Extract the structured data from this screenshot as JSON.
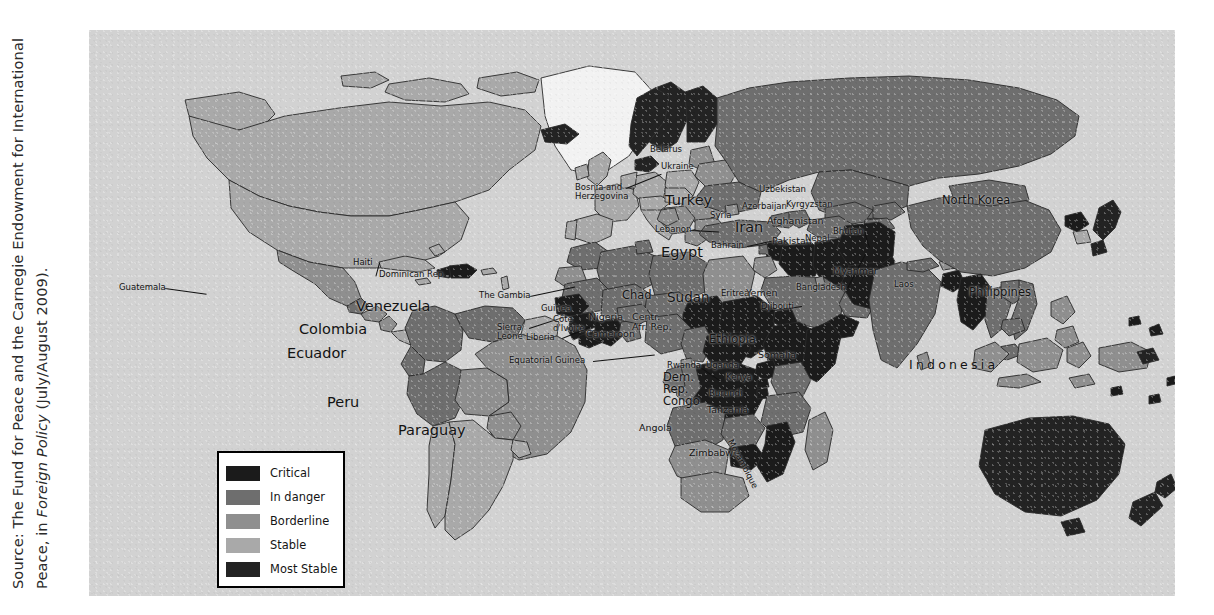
{
  "source": {
    "prefix": "Source: The Fund for Peace and the Carnegie Endowment for International Peace, in ",
    "italic": "Foreign Policy",
    "suffix": " (July/August 2009)."
  },
  "legend": {
    "title": "Failed States Index",
    "items": [
      {
        "label": "Critical",
        "color": "#1b1b1b"
      },
      {
        "label": "In danger",
        "color": "#6e6e6e"
      },
      {
        "label": "Borderline",
        "color": "#8f8f8f"
      },
      {
        "label": "Stable",
        "color": "#a9a9a9"
      },
      {
        "label": "Most Stable",
        "color": "#232323"
      }
    ]
  },
  "map": {
    "ocean_color": "#d2d2d2",
    "unshaded_color": "#f2f2f2",
    "border_color": "#2a2a2a",
    "labels": [
      {
        "name": "guatemala",
        "text": "Guatemala",
        "x": 30,
        "y": 253,
        "size": 8.5,
        "lead": {
          "len": 42,
          "angle": 8
        }
      },
      {
        "name": "haiti",
        "text": "Haiti",
        "x": 264,
        "y": 228,
        "size": 8.5,
        "lead": {
          "len": 14,
          "angle": 105
        }
      },
      {
        "name": "dominican-rep",
        "text": "Dominican Rep.",
        "x": 290,
        "y": 240,
        "size": 8.5,
        "lead": {
          "len": 0,
          "angle": 0
        }
      },
      {
        "name": "venezuela",
        "text": "Venezuela",
        "x": 267,
        "y": 269,
        "size": 14.5,
        "lead": null
      },
      {
        "name": "colombia",
        "text": "Colombia",
        "x": 210,
        "y": 292,
        "size": 14.5,
        "lead": null
      },
      {
        "name": "ecuador",
        "text": "Ecuador",
        "x": 198,
        "y": 316,
        "size": 14.5,
        "lead": null
      },
      {
        "name": "peru",
        "text": "Peru",
        "x": 238,
        "y": 365,
        "size": 14.5,
        "lead": null
      },
      {
        "name": "paraguay",
        "text": "Paraguay",
        "x": 309,
        "y": 393,
        "size": 14.5,
        "lead": null
      },
      {
        "name": "bosnia-herzegovina",
        "text": "Bosnia and\nHerzegovina",
        "x": 486,
        "y": 153,
        "size": 8.5,
        "lead": {
          "len": 38,
          "angle": -22
        }
      },
      {
        "name": "belarus",
        "text": "Belarus",
        "x": 561,
        "y": 115,
        "size": 8.5,
        "lead": null
      },
      {
        "name": "ukraine",
        "text": "Ukraine",
        "x": 572,
        "y": 132,
        "size": 8.5,
        "lead": null
      },
      {
        "name": "turkey",
        "text": "Turkey",
        "x": 576,
        "y": 163,
        "size": 14.5,
        "lead": null
      },
      {
        "name": "lebanon",
        "text": "Lebanon",
        "x": 566,
        "y": 195,
        "size": 8.5,
        "lead": {
          "len": 28,
          "angle": 3
        }
      },
      {
        "name": "syria",
        "text": "Syria",
        "x": 621,
        "y": 181,
        "size": 8.5,
        "lead": null
      },
      {
        "name": "egypt",
        "text": "Egypt",
        "x": 572,
        "y": 215,
        "size": 14.5,
        "lead": null
      },
      {
        "name": "bahrain",
        "text": "Bahrain",
        "x": 622,
        "y": 211,
        "size": 8.5,
        "lead": {
          "len": 30,
          "angle": -12
        }
      },
      {
        "name": "iran",
        "text": "Iran",
        "x": 646,
        "y": 190,
        "size": 14.5,
        "lead": null
      },
      {
        "name": "azerbaijan",
        "text": "Azerbaijan",
        "x": 653,
        "y": 172,
        "size": 8.5,
        "lead": null
      },
      {
        "name": "uzbekistan",
        "text": "Uzbekistan",
        "x": 670,
        "y": 155,
        "size": 8.5,
        "lead": null
      },
      {
        "name": "kyrgyzstan",
        "text": "Kyrgyzstan",
        "x": 697,
        "y": 170,
        "size": 8.5,
        "lead": null
      },
      {
        "name": "afghanistan",
        "text": "Afghanistan",
        "x": 678,
        "y": 186,
        "size": 9.5,
        "lead": null
      },
      {
        "name": "pakistan",
        "text": "Pakistan",
        "x": 683,
        "y": 206,
        "size": 9.5,
        "lead": null
      },
      {
        "name": "nepal",
        "text": "Nepal",
        "x": 716,
        "y": 204,
        "size": 8.5,
        "lead": null
      },
      {
        "name": "bhutan",
        "text": "Bhutan",
        "x": 744,
        "y": 197,
        "size": 8.5,
        "lead": {
          "len": 16,
          "angle": 72
        }
      },
      {
        "name": "bangladesh",
        "text": "Bangladesh",
        "x": 707,
        "y": 253,
        "size": 8.5,
        "lead": {
          "len": 38,
          "angle": -62
        }
      },
      {
        "name": "myanmar",
        "text": "Myanmar",
        "x": 744,
        "y": 236,
        "size": 9.5,
        "lead": null
      },
      {
        "name": "laos",
        "text": "Laos",
        "x": 805,
        "y": 250,
        "size": 8.5,
        "lead": null
      },
      {
        "name": "north-korea",
        "text": "North Korea",
        "x": 853,
        "y": 165,
        "size": 11.5,
        "lead": null
      },
      {
        "name": "philippines",
        "text": "Philippines",
        "x": 880,
        "y": 257,
        "size": 11.5,
        "lead": null
      },
      {
        "name": "indonesia",
        "text": "Indonesia",
        "x": 820,
        "y": 328,
        "size": 12.5,
        "spaced": true,
        "lead": null
      },
      {
        "name": "the-gambia",
        "text": "The Gambia",
        "x": 390,
        "y": 261,
        "size": 8.5,
        "lead": {
          "len": 46,
          "angle": -12
        }
      },
      {
        "name": "guinea",
        "text": "Guinea",
        "x": 452,
        "y": 274,
        "size": 8.5,
        "lead": null
      },
      {
        "name": "sierra-leone",
        "text": "Sierra\nLeone",
        "x": 408,
        "y": 293,
        "size": 8.5,
        "lead": {
          "len": 40,
          "angle": -18
        }
      },
      {
        "name": "liberia",
        "text": "Liberia",
        "x": 437,
        "y": 303,
        "size": 8.5,
        "lead": {
          "len": 30,
          "angle": -22
        }
      },
      {
        "name": "cote-divoire",
        "text": "Côte\nd'Ivoire",
        "x": 464,
        "y": 285,
        "size": 8.5,
        "lead": null
      },
      {
        "name": "equatorial-guinea",
        "text": "Equatorial Guinea",
        "x": 420,
        "y": 326,
        "size": 8.5,
        "lead": {
          "len": 62,
          "angle": -6
        }
      },
      {
        "name": "nigeria",
        "text": "Nigeria",
        "x": 500,
        "y": 282,
        "size": 9.5,
        "lead": null
      },
      {
        "name": "cameroon",
        "text": "Cameroon",
        "x": 497,
        "y": 299,
        "size": 9.5,
        "lead": null
      },
      {
        "name": "chad",
        "text": "Chad",
        "x": 533,
        "y": 260,
        "size": 11.5,
        "lead": null
      },
      {
        "name": "sudan",
        "text": "Sudan",
        "x": 578,
        "y": 260,
        "size": 13.5,
        "lead": null
      },
      {
        "name": "centr-afr-rep",
        "text": "Centr.\nAfr. Rep.",
        "x": 543,
        "y": 282,
        "size": 9.5,
        "lead": null
      },
      {
        "name": "eritrea",
        "text": "Eritrea",
        "x": 632,
        "y": 259,
        "size": 8.5,
        "lead": null
      },
      {
        "name": "yemen",
        "text": "Yemen",
        "x": 657,
        "y": 258,
        "size": 9.5,
        "lead": null
      },
      {
        "name": "djibouti",
        "text": "Djibouti",
        "x": 672,
        "y": 272,
        "size": 8.5,
        "lead": {
          "len": 34,
          "angle": 172
        }
      },
      {
        "name": "ethiopia",
        "text": "Ethiopia",
        "x": 620,
        "y": 304,
        "size": 11.5,
        "lead": null
      },
      {
        "name": "somalia",
        "text": "Somalia",
        "x": 669,
        "y": 320,
        "size": 9.5,
        "lead": null
      },
      {
        "name": "rwanda",
        "text": "Rwanda",
        "x": 578,
        "y": 331,
        "size": 8.5,
        "lead": {
          "len": 26,
          "angle": 34
        }
      },
      {
        "name": "uganda",
        "text": "Uganda",
        "x": 617,
        "y": 331,
        "size": 8.5,
        "lead": null
      },
      {
        "name": "kenya",
        "text": "Kenya",
        "x": 637,
        "y": 343,
        "size": 8.5,
        "lead": null
      },
      {
        "name": "dem-rep-congo",
        "text": "Dem.\nRep.\nCongo",
        "x": 574,
        "y": 342,
        "size": 11.5,
        "lead": null
      },
      {
        "name": "burundi",
        "text": "Burundi",
        "x": 620,
        "y": 359,
        "size": 8.5,
        "lead": {
          "len": 22,
          "angle": 190
        }
      },
      {
        "name": "tanzania",
        "text": "Tanzania",
        "x": 618,
        "y": 375,
        "size": 9.5,
        "lead": null
      },
      {
        "name": "angola",
        "text": "Angola",
        "x": 550,
        "y": 393,
        "size": 9.5,
        "lead": null
      },
      {
        "name": "zimbabwe",
        "text": "Zimbabwe",
        "x": 600,
        "y": 418,
        "size": 9.5,
        "lead": null
      },
      {
        "name": "mozambique",
        "text": "Mozambique",
        "x": 645,
        "y": 408,
        "size": 8.5,
        "rotate": 62,
        "lead": null
      }
    ]
  }
}
